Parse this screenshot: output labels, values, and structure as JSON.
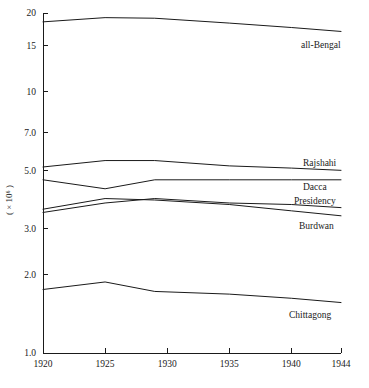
{
  "chart_data": {
    "type": "line",
    "title": "",
    "subtitle": "",
    "xlabel": "",
    "ylabel": "( × 10⁶ )",
    "yscale": "log",
    "ylim": [
      1.0,
      20.0
    ],
    "xlim": [
      1920,
      1944
    ],
    "grid": false,
    "legend_position": "right-inline-labels",
    "x_ticks": [
      1920,
      1925,
      1930,
      1935,
      1940,
      1944
    ],
    "x_tick_labels": [
      "1920",
      "1925",
      "1930",
      "1935",
      "1940",
      "1944"
    ],
    "y_ticks": [
      1.0,
      2.0,
      3.0,
      5.0,
      7.0,
      10.0,
      15.0,
      20.0
    ],
    "y_tick_labels": [
      "1.0",
      "2.0",
      "3.0",
      "5.0",
      "7.0",
      "10",
      "15",
      "20"
    ],
    "series": [
      {
        "name": "all-Bengal",
        "label": "all-Bengal",
        "x": [
          1920,
          1925,
          1929,
          1935,
          1940,
          1944
        ],
        "values": [
          18.5,
          19.2,
          19.1,
          18.3,
          17.6,
          17.0
        ]
      },
      {
        "name": "Rajshahi",
        "label": "Rajshahi",
        "x": [
          1920,
          1925,
          1929,
          1935,
          1940,
          1944
        ],
        "values": [
          5.15,
          5.45,
          5.45,
          5.2,
          5.1,
          5.0
        ]
      },
      {
        "name": "Dacca",
        "label": "Dacca",
        "x": [
          1920,
          1925,
          1929,
          1935,
          1940,
          1944
        ],
        "values": [
          4.6,
          4.25,
          4.6,
          4.6,
          4.6,
          4.6
        ]
      },
      {
        "name": "Presidency",
        "label": "Presidency",
        "x": [
          1920,
          1925,
          1929,
          1935,
          1940,
          1944
        ],
        "values": [
          3.45,
          3.75,
          3.9,
          3.75,
          3.7,
          3.6
        ]
      },
      {
        "name": "Burdwan",
        "label": "Burdwan",
        "x": [
          1920,
          1925,
          1929,
          1935,
          1940,
          1944
        ],
        "values": [
          3.55,
          3.9,
          3.85,
          3.7,
          3.5,
          3.35
        ]
      },
      {
        "name": "Chittagong",
        "label": "Chittagong",
        "x": [
          1920,
          1925,
          1929,
          1935,
          1940,
          1944
        ],
        "values": [
          1.75,
          1.87,
          1.72,
          1.68,
          1.62,
          1.56
        ]
      }
    ]
  },
  "colors": {
    "line": "#1a1a1a",
    "axis": "#1a1a1a",
    "background": "#ffffff"
  }
}
